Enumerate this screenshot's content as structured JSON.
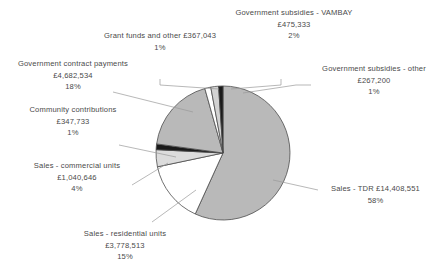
{
  "chart_data": {
    "type": "pie",
    "title": "",
    "legend_position": "callout-labels",
    "grid": false,
    "currency": "£",
    "center": {
      "x": 223,
      "y": 153
    },
    "radius": 67,
    "start_angle_deg": -90,
    "direction": "clockwise",
    "categories": [
      "Sales - TDR",
      "Sales - residential units",
      "Sales - commercial units",
      "Community contributions",
      "Government contract payments",
      "Grant funds and other",
      "Government subsidies - VAMBAY",
      "Government subsidies - other"
    ],
    "values": [
      14408551,
      3778513,
      1040646,
      347733,
      4682534,
      367043,
      475333,
      267200
    ],
    "percent": [
      58,
      15,
      4,
      1,
      18,
      1,
      2,
      1
    ],
    "colors": [
      "#b9b9b9",
      "#ffffff",
      "#dcdcdc",
      "#1a1a1a",
      "#b9b9b9",
      "#ffffff",
      "#d2d2d2",
      "#1a1a1a"
    ],
    "slices": [
      {
        "name": "Sales - TDR",
        "value": 14408551,
        "percent": 58,
        "color": "#b9b9b9"
      },
      {
        "name": "Sales - residential units",
        "value": 3778513,
        "percent": 15,
        "color": "#ffffff"
      },
      {
        "name": "Sales - commercial units",
        "value": 1040646,
        "percent": 4,
        "color": "#dcdcdc"
      },
      {
        "name": "Community contributions",
        "value": 347733,
        "percent": 1,
        "color": "#1a1a1a"
      },
      {
        "name": "Government contract payments",
        "value": 4682534,
        "percent": 18,
        "color": "#b9b9b9"
      },
      {
        "name": "Grant funds and other",
        "value": 367043,
        "percent": 1,
        "color": "#ffffff"
      },
      {
        "name": "Government subsidies - VAMBAY",
        "value": 475333,
        "percent": 2,
        "color": "#d2d2d2"
      },
      {
        "name": "Government subsidies - other",
        "value": 267200,
        "percent": 1,
        "color": "#1a1a1a"
      }
    ]
  },
  "labels": {
    "vambay": {
      "line1": "Government subsidies - VAMBAY",
      "line2": "£475,333",
      "line3": "2%"
    },
    "grant_funds": {
      "line1": "Grant funds and other £367,043",
      "line2": "1%"
    },
    "subsidies_other": {
      "line1": "Government subsidies - other",
      "line2": "£267,200",
      "line3": "1%"
    },
    "contract_payments": {
      "line1": "Government contract payments",
      "line2": "£4,682,534",
      "line3": "18%"
    },
    "community": {
      "line1": "Community  contributions",
      "line2": "£347,733",
      "line3": "1%"
    },
    "commercial": {
      "line1": "Sales - commercial units",
      "line2": "£1,040,646",
      "line3": "4%"
    },
    "tdr": {
      "line1": "Sales - TDR £14,408,551",
      "line2": "58%"
    },
    "residential": {
      "line1": "Sales - residential units",
      "line2": "£3,778,513",
      "line3": "15%"
    }
  }
}
